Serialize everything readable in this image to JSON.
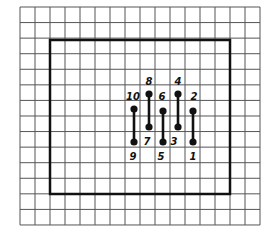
{
  "diagram": {
    "grid": {
      "x0": 20,
      "y0": 7,
      "cols": 16,
      "rows": 14,
      "cell_w": 15,
      "cell_h": 15.57,
      "line_color": "#555555"
    },
    "board": {
      "x": 50,
      "y": 40,
      "width": 180,
      "height": 154,
      "stroke_color": "#111111"
    },
    "pins": [
      {
        "top_label": "10",
        "bottom_label": "9",
        "x": 134,
        "y_top": 109,
        "y_bottom": 142,
        "top_label_pos": [
          133,
          100
        ],
        "bottom_label_pos": [
          133,
          160
        ]
      },
      {
        "top_label": "8",
        "bottom_label": "7",
        "x": 149,
        "y_top": 94,
        "y_bottom": 127,
        "top_label_pos": [
          149,
          85
        ],
        "bottom_label_pos": [
          147,
          145
        ]
      },
      {
        "top_label": "6",
        "bottom_label": "5",
        "x": 163,
        "y_top": 111,
        "y_bottom": 142,
        "top_label_pos": [
          162,
          100
        ],
        "bottom_label_pos": [
          161,
          160
        ]
      },
      {
        "top_label": "4",
        "bottom_label": "3",
        "x": 178,
        "y_top": 94,
        "y_bottom": 127,
        "top_label_pos": [
          178,
          85
        ],
        "bottom_label_pos": [
          174,
          145
        ]
      },
      {
        "top_label": "2",
        "bottom_label": "1",
        "x": 193,
        "y_top": 111,
        "y_bottom": 142,
        "top_label_pos": [
          194,
          100
        ],
        "bottom_label_pos": [
          193,
          160
        ]
      }
    ]
  }
}
